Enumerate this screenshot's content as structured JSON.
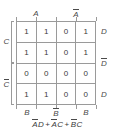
{
  "figure": {
    "type": "karnaugh-map",
    "rows": 4,
    "cols": 4,
    "grid_color": "#9a9a9a",
    "text_color": "#3a3a3a",
    "background": "#ffffff"
  },
  "top_labels": [
    {
      "text": "A",
      "overbar": false
    },
    {
      "text": "A",
      "overbar": true
    }
  ],
  "bottom_labels": [
    {
      "text": "B",
      "overbar": false
    },
    {
      "text": "B",
      "overbar": true
    },
    {
      "text": "B",
      "overbar": false
    }
  ],
  "left_labels": [
    {
      "text": "C",
      "overbar": false
    },
    {
      "text": "C",
      "overbar": true
    }
  ],
  "right_labels": [
    {
      "text": "D",
      "overbar": false
    },
    {
      "text": "D",
      "overbar": true
    },
    {
      "text": "D",
      "overbar": false
    }
  ],
  "cells": [
    [
      "1",
      "1",
      "0",
      "1"
    ],
    [
      "1",
      "1",
      "0",
      "1"
    ],
    [
      "0",
      "0",
      "0",
      "0"
    ],
    [
      "1",
      "1",
      "0",
      "0"
    ]
  ],
  "formula": {
    "full_text": "A̅D + A̅C + B̅C",
    "terms": [
      {
        "vars": [
          {
            "text": "A",
            "overbar": true
          },
          {
            "text": "D",
            "overbar": false
          }
        ]
      },
      {
        "vars": [
          {
            "text": "A",
            "overbar": true
          },
          {
            "text": "C",
            "overbar": false
          }
        ]
      },
      {
        "vars": [
          {
            "text": "B",
            "overbar": true
          },
          {
            "text": "C",
            "overbar": false
          }
        ]
      }
    ],
    "operator": "+"
  }
}
